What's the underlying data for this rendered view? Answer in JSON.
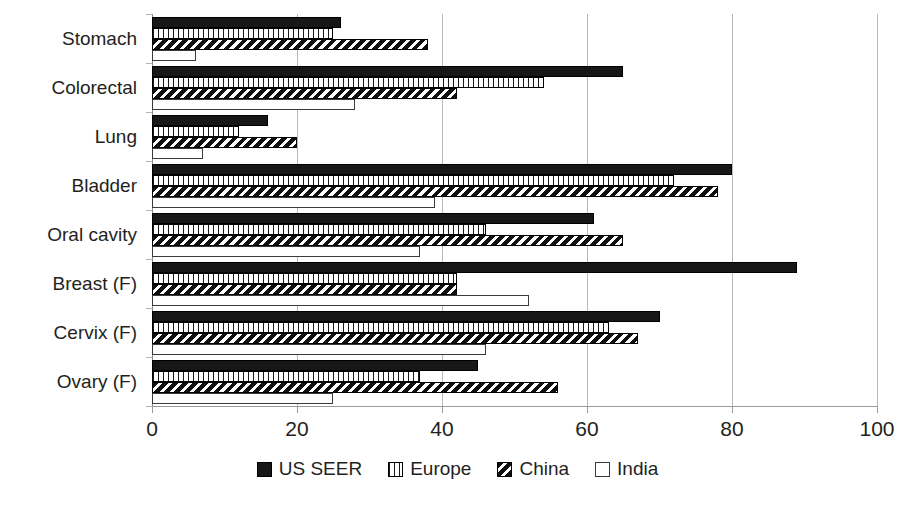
{
  "chart_data": {
    "type": "bar",
    "orientation": "horizontal",
    "title": "",
    "xlabel": "",
    "ylabel": "",
    "xlim": [
      0,
      100
    ],
    "xticks": [
      0,
      20,
      40,
      60,
      80,
      100
    ],
    "xtick_labels": [
      "0",
      "20",
      "40",
      "60",
      "80",
      "100"
    ],
    "grid": true,
    "legend_position": "bottom",
    "categories": [
      "Stomach",
      "Colorectal",
      "Lung",
      "Bladder",
      "Oral cavity",
      "Breast (F)",
      "Cervix (F)",
      "Ovary (F)"
    ],
    "series": [
      {
        "name": "US SEER",
        "pattern": "solid-black",
        "color": "#171717",
        "values": [
          26,
          65,
          16,
          80,
          61,
          89,
          70,
          45
        ]
      },
      {
        "name": "Europe",
        "pattern": "dotted",
        "color": "#ffffff",
        "values": [
          25,
          54,
          12,
          72,
          46,
          42,
          63,
          37
        ]
      },
      {
        "name": "China",
        "pattern": "diagonal-hatch",
        "color": "#101010",
        "values": [
          38,
          42,
          20,
          78,
          65,
          42,
          67,
          56
        ]
      },
      {
        "name": "India",
        "pattern": "open-white",
        "color": "#ffffff",
        "values": [
          6,
          28,
          7,
          39,
          37,
          52,
          46,
          25
        ]
      }
    ]
  },
  "legend": {
    "items": [
      {
        "label": "US SEER",
        "swatch": "solid-black-swatch"
      },
      {
        "label": "Europe",
        "swatch": "dotted-swatch"
      },
      {
        "label": "China",
        "swatch": "diagonal-hatch-swatch"
      },
      {
        "label": "India",
        "swatch": "open-white-swatch"
      }
    ]
  }
}
